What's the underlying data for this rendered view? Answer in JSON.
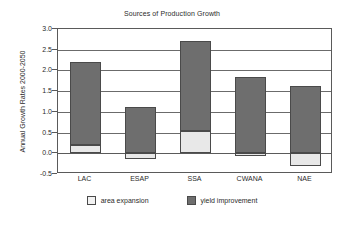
{
  "chart_data": {
    "type": "bar",
    "subtype": "stacked",
    "title": "Sources of Production Growth",
    "xlabel": "",
    "ylabel": "Annual Growth Rates 2000-2050",
    "categories": [
      "LAC",
      "ESAP",
      "SSA",
      "CWANA",
      "NAE"
    ],
    "series": [
      {
        "name": "area expansion",
        "color": "#e8e8e8",
        "values": [
          0.2,
          -0.13,
          0.53,
          -0.06,
          -0.3
        ]
      },
      {
        "name": "yield improvement",
        "color": "#6e6e6e",
        "values": [
          2.0,
          1.12,
          2.19,
          1.85,
          1.62
        ]
      }
    ],
    "totals": [
      2.2,
      1.12,
      2.72,
      1.79,
      1.32
    ],
    "ylim": [
      -0.5,
      3.0
    ],
    "ytick_step": 0.5,
    "yticks": [
      "3.0",
      "2.5",
      "2.0",
      "1.5",
      "1.0",
      "0.5",
      "0.0",
      "-0.5"
    ],
    "ytick_values": [
      3.0,
      2.5,
      2.0,
      1.5,
      1.0,
      0.5,
      0.0,
      -0.5
    ],
    "grid": true,
    "grid_axis": "y",
    "legend_position": "bottom"
  },
  "legend": {
    "entries": [
      {
        "label": "area expansion",
        "swatch": "light-square-swatch"
      },
      {
        "label": "yield improvement",
        "swatch": "dark-square-swatch"
      }
    ]
  }
}
